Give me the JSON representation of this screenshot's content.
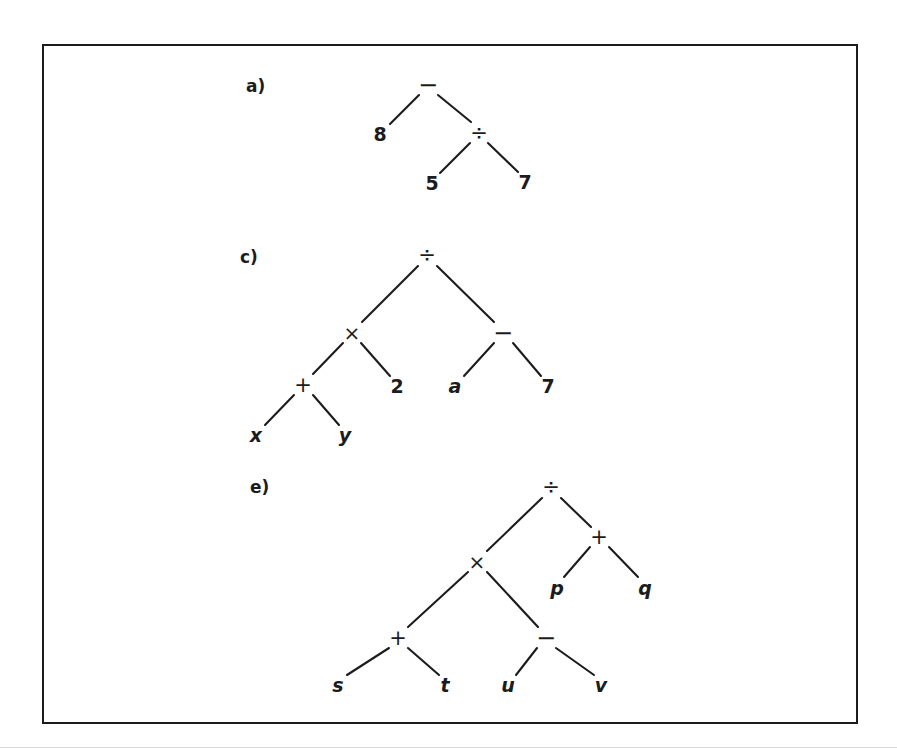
{
  "figure": {
    "background_color": "#ffffff",
    "ink_color": "#1c1c1c",
    "frame": {
      "x": 42,
      "y": 44,
      "width": 816,
      "height": 680,
      "border_width": 2
    },
    "caption_rule_y": 747
  },
  "panels": [
    {
      "id": "a",
      "label": "a)",
      "label_x": 246,
      "label_y": 86,
      "nodes": [
        {
          "id": "a-root",
          "text": "−",
          "kind": "op-minus",
          "x": 428,
          "y": 85,
          "name": "node-minus-root"
        },
        {
          "id": "a-8",
          "text": "8",
          "kind": "num",
          "x": 380,
          "y": 134,
          "name": "node-8"
        },
        {
          "id": "a-div",
          "text": "÷",
          "kind": "op",
          "x": 479,
          "y": 133,
          "name": "node-divide"
        },
        {
          "id": "a-5",
          "text": "5",
          "kind": "num",
          "x": 432,
          "y": 183,
          "name": "node-5"
        },
        {
          "id": "a-7",
          "text": "7",
          "kind": "num",
          "x": 525,
          "y": 182,
          "name": "node-7"
        }
      ],
      "edges": [
        {
          "from": "a-root",
          "to": "a-8",
          "x1": 419,
          "y1": 95,
          "x2": 390,
          "y2": 124
        },
        {
          "from": "a-root",
          "to": "a-div",
          "x1": 438,
          "y1": 95,
          "x2": 471,
          "y2": 122
        },
        {
          "from": "a-div",
          "to": "a-5",
          "x1": 470,
          "y1": 143,
          "x2": 440,
          "y2": 173
        },
        {
          "from": "a-div",
          "to": "a-7",
          "x1": 488,
          "y1": 143,
          "x2": 518,
          "y2": 172
        }
      ],
      "expression": "8 - (5 / 7)"
    },
    {
      "id": "c",
      "label": "c)",
      "label_x": 240,
      "label_y": 257,
      "nodes": [
        {
          "id": "c-root",
          "text": "÷",
          "kind": "op",
          "x": 427,
          "y": 255,
          "name": "node-divide-root"
        },
        {
          "id": "c-times",
          "text": "×",
          "kind": "op-times",
          "x": 352,
          "y": 333,
          "name": "node-times"
        },
        {
          "id": "c-minus",
          "text": "−",
          "kind": "op-minus",
          "x": 503,
          "y": 333,
          "name": "node-minus"
        },
        {
          "id": "c-plus",
          "text": "+",
          "kind": "op",
          "x": 303,
          "y": 385,
          "name": "node-plus"
        },
        {
          "id": "c-2",
          "text": "2",
          "kind": "num",
          "x": 397,
          "y": 386,
          "name": "node-2"
        },
        {
          "id": "c-a",
          "text": "a",
          "kind": "var",
          "x": 455,
          "y": 386,
          "name": "node-a"
        },
        {
          "id": "c-7",
          "text": "7",
          "kind": "num",
          "x": 548,
          "y": 386,
          "name": "node-7"
        },
        {
          "id": "c-x",
          "text": "x",
          "kind": "var",
          "x": 256,
          "y": 435,
          "name": "node-x"
        },
        {
          "id": "c-y",
          "text": "y",
          "kind": "var",
          "x": 345,
          "y": 435,
          "name": "node-y"
        }
      ],
      "edges": [
        {
          "from": "c-root",
          "to": "c-times",
          "x1": 418,
          "y1": 266,
          "x2": 362,
          "y2": 322
        },
        {
          "from": "c-root",
          "to": "c-minus",
          "x1": 437,
          "y1": 266,
          "x2": 494,
          "y2": 322
        },
        {
          "from": "c-times",
          "to": "c-plus",
          "x1": 343,
          "y1": 343,
          "x2": 313,
          "y2": 374
        },
        {
          "from": "c-times",
          "to": "c-2",
          "x1": 361,
          "y1": 343,
          "x2": 390,
          "y2": 376
        },
        {
          "from": "c-minus",
          "to": "c-a",
          "x1": 494,
          "y1": 343,
          "x2": 464,
          "y2": 376
        },
        {
          "from": "c-minus",
          "to": "c-7",
          "x1": 513,
          "y1": 343,
          "x2": 541,
          "y2": 376
        },
        {
          "from": "c-plus",
          "to": "c-x",
          "x1": 294,
          "y1": 395,
          "x2": 265,
          "y2": 425
        },
        {
          "from": "c-plus",
          "to": "c-y",
          "x1": 313,
          "y1": 395,
          "x2": 339,
          "y2": 425
        }
      ],
      "expression": "((x + y) * 2) / (a - 7)"
    },
    {
      "id": "e",
      "label": "e)",
      "label_x": 250,
      "label_y": 487,
      "nodes": [
        {
          "id": "e-root",
          "text": "÷",
          "kind": "op",
          "x": 551,
          "y": 487,
          "name": "node-divide-root"
        },
        {
          "id": "e-times",
          "text": "×",
          "kind": "op-times",
          "x": 477,
          "y": 562,
          "name": "node-times"
        },
        {
          "id": "e-plus-r",
          "text": "+",
          "kind": "op",
          "x": 599,
          "y": 537,
          "name": "node-plus-right"
        },
        {
          "id": "e-p",
          "text": "p",
          "kind": "var",
          "x": 557,
          "y": 588,
          "name": "node-p"
        },
        {
          "id": "e-q",
          "text": "q",
          "kind": "var",
          "x": 645,
          "y": 588,
          "name": "node-q"
        },
        {
          "id": "e-plus-l",
          "text": "+",
          "kind": "op",
          "x": 398,
          "y": 638,
          "name": "node-plus-left"
        },
        {
          "id": "e-minus",
          "text": "−",
          "kind": "op-minus",
          "x": 546,
          "y": 638,
          "name": "node-minus"
        },
        {
          "id": "e-s",
          "text": "s",
          "kind": "var",
          "x": 338,
          "y": 685,
          "name": "node-s"
        },
        {
          "id": "e-t",
          "text": "t",
          "kind": "var",
          "x": 445,
          "y": 685,
          "name": "node-t"
        },
        {
          "id": "e-u",
          "text": "u",
          "kind": "var",
          "x": 508,
          "y": 685,
          "name": "node-u"
        },
        {
          "id": "e-v",
          "text": "v",
          "kind": "var",
          "x": 601,
          "y": 685,
          "name": "node-v"
        }
      ],
      "edges": [
        {
          "from": "e-root",
          "to": "e-times",
          "x1": 542,
          "y1": 498,
          "x2": 487,
          "y2": 551
        },
        {
          "from": "e-root",
          "to": "e-plus-r",
          "x1": 561,
          "y1": 498,
          "x2": 591,
          "y2": 527
        },
        {
          "from": "e-plus-r",
          "to": "e-p",
          "x1": 590,
          "y1": 547,
          "x2": 564,
          "y2": 577
        },
        {
          "from": "e-plus-r",
          "to": "e-q",
          "x1": 609,
          "y1": 547,
          "x2": 638,
          "y2": 577
        },
        {
          "from": "e-times",
          "to": "e-plus-l",
          "x1": 468,
          "y1": 572,
          "x2": 408,
          "y2": 627
        },
        {
          "from": "e-times",
          "to": "e-minus",
          "x1": 487,
          "y1": 572,
          "x2": 538,
          "y2": 627
        },
        {
          "from": "e-plus-l",
          "to": "e-s",
          "x1": 389,
          "y1": 648,
          "x2": 347,
          "y2": 675
        },
        {
          "from": "e-plus-l",
          "to": "e-t",
          "x1": 408,
          "y1": 648,
          "x2": 439,
          "y2": 675
        },
        {
          "from": "e-minus",
          "to": "e-u",
          "x1": 537,
          "y1": 648,
          "x2": 516,
          "y2": 675
        },
        {
          "from": "e-minus",
          "to": "e-v",
          "x1": 556,
          "y1": 648,
          "x2": 594,
          "y2": 675
        }
      ],
      "expression": "((s + t) * (u - v)) / (p + q)"
    }
  ]
}
